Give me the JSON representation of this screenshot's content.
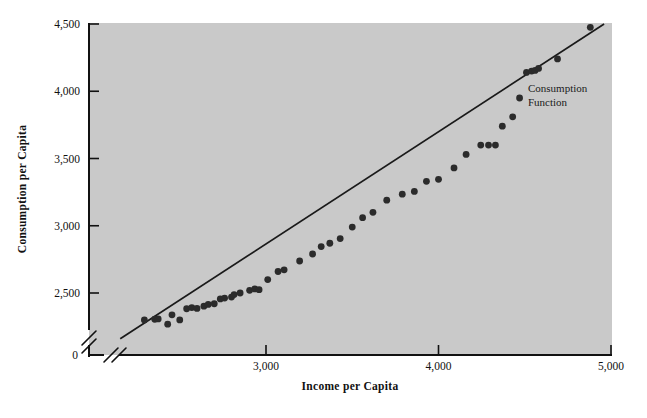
{
  "chart_data": {
    "type": "scatter",
    "title": "",
    "xlabel": "Income per Capita",
    "ylabel": "Consumption per Capita",
    "xlim": [
      2100,
      5000
    ],
    "ylim": [
      2150,
      4500
    ],
    "xticks": [
      3000,
      4000,
      5000
    ],
    "xtick_labels": [
      "3,000",
      "4,000",
      "5,000"
    ],
    "yticks": [
      2500,
      3000,
      3500,
      4000,
      4500
    ],
    "ytick_labels": [
      "2,500",
      "3,000",
      "3,500",
      "4,000",
      "4,500"
    ],
    "origin_label": "0",
    "axis_break": true,
    "grid": false,
    "legend_position": "none",
    "plot_background": "#c9c9c9",
    "point_color": "#2b2b2b",
    "line_color": "#1a1a1a",
    "annotations": [
      {
        "text_line1": "Consumption",
        "text_line2": "Function",
        "x": 4590,
        "y": 4020
      }
    ],
    "fit_line": {
      "name": "Consumption Function",
      "x_start": 2155,
      "y_start": 2160,
      "x_end": 4960,
      "y_end": 4500
    },
    "series": [
      {
        "name": "Consumption vs Income",
        "points": [
          [
            2295,
            2300
          ],
          [
            2355,
            2305
          ],
          [
            2375,
            2307
          ],
          [
            2430,
            2268
          ],
          [
            2455,
            2338
          ],
          [
            2500,
            2300
          ],
          [
            2540,
            2383
          ],
          [
            2570,
            2392
          ],
          [
            2600,
            2385
          ],
          [
            2640,
            2402
          ],
          [
            2665,
            2415
          ],
          [
            2700,
            2420
          ],
          [
            2735,
            2456
          ],
          [
            2760,
            2462
          ],
          [
            2800,
            2470
          ],
          [
            2815,
            2488
          ],
          [
            2850,
            2500
          ],
          [
            2905,
            2520
          ],
          [
            2935,
            2530
          ],
          [
            2960,
            2525
          ],
          [
            3010,
            2600
          ],
          [
            3070,
            2660
          ],
          [
            3105,
            2672
          ],
          [
            3195,
            2738
          ],
          [
            3270,
            2790
          ],
          [
            3320,
            2845
          ],
          [
            3370,
            2870
          ],
          [
            3430,
            2905
          ],
          [
            3500,
            2990
          ],
          [
            3560,
            3060
          ],
          [
            3620,
            3100
          ],
          [
            3700,
            3190
          ],
          [
            3790,
            3235
          ],
          [
            3860,
            3255
          ],
          [
            3930,
            3330
          ],
          [
            4000,
            3345
          ],
          [
            4090,
            3430
          ],
          [
            4160,
            3530
          ],
          [
            4245,
            3600
          ],
          [
            4290,
            3600
          ],
          [
            4330,
            3600
          ],
          [
            4370,
            3740
          ],
          [
            4430,
            3810
          ],
          [
            4470,
            3950
          ],
          [
            4510,
            4140
          ],
          [
            4540,
            4150
          ],
          [
            4560,
            4155
          ],
          [
            4580,
            4170
          ],
          [
            4690,
            4240
          ],
          [
            4880,
            4475
          ]
        ]
      }
    ]
  },
  "axis": {
    "y_title": "Consumption per Capita",
    "x_title": "Income per Capita",
    "origin": "0"
  }
}
